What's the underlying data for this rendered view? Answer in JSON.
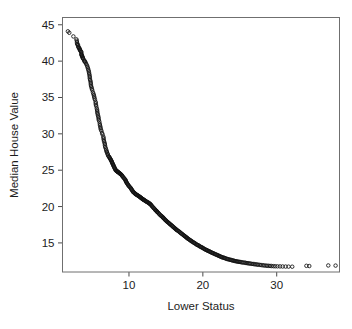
{
  "chart_data": {
    "type": "scatter",
    "title": "",
    "xlabel": "Lower Status",
    "ylabel": "Median House Value",
    "xlim": [
      1.0,
      38.5
    ],
    "ylim": [
      11.0,
      46.0
    ],
    "xticks": [
      10,
      20,
      30
    ],
    "yticks": [
      15,
      20,
      25,
      30,
      35,
      40,
      45
    ],
    "xtick_labels": [
      "10",
      "20",
      "30"
    ],
    "ytick_labels": [
      "15",
      "20",
      "25",
      "30",
      "35",
      "40",
      "45"
    ],
    "grid": false,
    "legend": null,
    "marker": "open-circle",
    "marker_color": "#101010",
    "background": "#ffffff",
    "frame_color": "#6f6f6f",
    "x": [
      1.73,
      1.92,
      2.47,
      2.88,
      2.94,
      2.96,
      2.98,
      3.01,
      3.11,
      3.13,
      3.16,
      3.26,
      3.32,
      3.33,
      3.38,
      3.43,
      3.53,
      3.54,
      3.56,
      3.57,
      3.59,
      3.65,
      3.7,
      3.73,
      3.76,
      3.81,
      3.95,
      3.97,
      4.03,
      4.14,
      4.21,
      4.32,
      4.38,
      4.45,
      4.5,
      4.56,
      4.59,
      4.63,
      4.67,
      4.69,
      4.7,
      4.74,
      4.81,
      4.82,
      4.84,
      4.86,
      4.93,
      4.97,
      5.03,
      5.12,
      5.19,
      5.25,
      5.29,
      5.33,
      5.39,
      5.49,
      5.5,
      5.52,
      5.57,
      5.64,
      5.68,
      5.7,
      5.72,
      5.77,
      5.81,
      5.87,
      5.89,
      5.91,
      5.98,
      6.05,
      6.07,
      6.12,
      6.15,
      6.19,
      6.27,
      6.36,
      6.43,
      6.53,
      6.56,
      6.58,
      6.62,
      6.68,
      6.73,
      6.75,
      6.78,
      6.86,
      6.92,
      6.96,
      7.01,
      7.08,
      7.12,
      7.18,
      7.26,
      7.34,
      7.39,
      7.43,
      7.51,
      7.56,
      7.6,
      7.67,
      7.7,
      7.73,
      7.79,
      7.83,
      7.88,
      7.91,
      7.96,
      8.01,
      8.05,
      8.1,
      8.16,
      8.2,
      8.26,
      8.33,
      8.4,
      8.44,
      8.47,
      8.51,
      8.58,
      8.65,
      8.7,
      8.77,
      8.81,
      8.88,
      8.94,
      9.04,
      9.1,
      9.16,
      9.25,
      9.33,
      9.42,
      9.5,
      9.53,
      9.59,
      9.62,
      9.68,
      9.74,
      9.8,
      9.88,
      9.93,
      10.0,
      10.11,
      10.19,
      10.27,
      10.3,
      10.4,
      10.45,
      10.5,
      10.58,
      10.63,
      10.71,
      10.8,
      10.87,
      10.92,
      10.97,
      11.08,
      11.16,
      11.22,
      11.28,
      11.38,
      11.45,
      11.5,
      11.57,
      11.64,
      11.69,
      11.74,
      11.81,
      11.88,
      11.93,
      11.98,
      12.03,
      12.12,
      12.2,
      12.26,
      12.33,
      12.43,
      12.5,
      12.6,
      12.67,
      12.73,
      12.8,
      12.86,
      12.93,
      13.0,
      13.09,
      13.15,
      13.27,
      13.33,
      13.44,
      13.51,
      13.6,
      13.65,
      13.72,
      13.79,
      13.83,
      13.9,
      13.99,
      14.09,
      14.15,
      14.27,
      14.33,
      14.44,
      14.52,
      14.59,
      14.65,
      14.7,
      14.79,
      14.86,
      14.94,
      15.02,
      15.1,
      15.17,
      15.27,
      15.37,
      15.45,
      15.52,
      15.6,
      15.71,
      15.79,
      15.88,
      15.94,
      16.03,
      16.12,
      16.21,
      16.29,
      16.35,
      16.42,
      16.51,
      16.6,
      16.72,
      16.8,
      16.9,
      16.98,
      17.07,
      17.16,
      17.27,
      17.36,
      17.44,
      17.55,
      17.6,
      17.7,
      17.79,
      17.86,
      17.93,
      18.03,
      18.13,
      18.22,
      18.33,
      18.4,
      18.5,
      18.6,
      18.72,
      18.8,
      18.9,
      19.01,
      19.11,
      19.2,
      19.31,
      19.4,
      19.52,
      19.6,
      19.73,
      19.82,
      19.92,
      20.02,
      20.14,
      20.22,
      20.32,
      20.45,
      20.54,
      20.62,
      20.73,
      20.85,
      20.94,
      21.03,
      21.14,
      21.24,
      21.35,
      21.46,
      21.57,
      21.68,
      21.79,
      21.9,
      22.02,
      22.11,
      22.22,
      22.33,
      22.44,
      22.55,
      22.66,
      22.78,
      22.89,
      23.0,
      23.12,
      23.24,
      23.35,
      23.46,
      23.6,
      23.72,
      23.85,
      23.97,
      24.1,
      24.22,
      24.35,
      24.5,
      24.62,
      24.77,
      24.91,
      25.05,
      25.2,
      25.35,
      25.5,
      25.68,
      25.82,
      25.98,
      26.14,
      26.3,
      26.45,
      26.64,
      26.82,
      26.98,
      27.15,
      27.33,
      27.5,
      27.71,
      27.9,
      28.1,
      28.3,
      28.5,
      28.7,
      28.9,
      29.1,
      29.3,
      29.55,
      29.8,
      30.1,
      30.45,
      30.8,
      31.2,
      31.6,
      32.1,
      34.02,
      34.41,
      36.98,
      37.97
    ],
    "y": [
      44.1,
      43.9,
      43.4,
      43.0,
      42.8,
      42.6,
      42.4,
      42.3,
      42.2,
      42.0,
      41.9,
      41.8,
      41.7,
      41.6,
      41.5,
      41.4,
      41.3,
      41.2,
      41.0,
      40.9,
      40.8,
      40.7,
      40.6,
      40.5,
      40.4,
      40.3,
      40.1,
      40.0,
      39.9,
      39.8,
      39.6,
      39.4,
      39.2,
      39.0,
      38.8,
      38.6,
      38.4,
      38.2,
      38.0,
      37.8,
      37.6,
      37.4,
      37.2,
      37.0,
      36.8,
      36.6,
      36.4,
      36.2,
      36.0,
      35.7,
      35.5,
      35.3,
      35.1,
      34.9,
      34.7,
      34.4,
      34.2,
      34.0,
      33.8,
      33.5,
      33.3,
      33.1,
      32.9,
      32.7,
      32.5,
      32.3,
      32.1,
      31.9,
      31.7,
      31.4,
      31.2,
      31.0,
      30.8,
      30.6,
      30.4,
      30.1,
      29.9,
      29.6,
      29.4,
      29.2,
      29.0,
      28.8,
      28.6,
      28.4,
      28.2,
      28.0,
      27.8,
      27.6,
      27.5,
      27.3,
      27.2,
      27.0,
      26.9,
      26.8,
      26.7,
      26.6,
      26.5,
      26.4,
      26.3,
      26.2,
      26.1,
      26.0,
      25.9,
      25.8,
      25.7,
      25.6,
      25.5,
      25.4,
      25.3,
      25.2,
      25.1,
      25.0,
      24.95,
      24.9,
      24.85,
      24.8,
      24.78,
      24.75,
      24.7,
      24.65,
      24.6,
      24.55,
      24.5,
      24.45,
      24.4,
      24.3,
      24.2,
      24.1,
      24.0,
      23.9,
      23.8,
      23.7,
      23.6,
      23.5,
      23.4,
      23.3,
      23.2,
      23.1,
      23.0,
      22.9,
      22.8,
      22.7,
      22.6,
      22.5,
      22.4,
      22.3,
      22.2,
      22.1,
      22.0,
      21.95,
      21.9,
      21.8,
      21.75,
      21.7,
      21.65,
      21.6,
      21.55,
      21.5,
      21.45,
      21.4,
      21.35,
      21.3,
      21.25,
      21.2,
      21.15,
      21.1,
      21.05,
      21.0,
      20.98,
      20.95,
      20.9,
      20.85,
      20.8,
      20.75,
      20.7,
      20.65,
      20.6,
      20.55,
      20.5,
      20.45,
      20.4,
      20.35,
      20.3,
      20.2,
      20.1,
      20.0,
      19.9,
      19.8,
      19.7,
      19.6,
      19.5,
      19.45,
      19.4,
      19.3,
      19.25,
      19.2,
      19.1,
      19.0,
      18.9,
      18.8,
      18.75,
      18.65,
      18.6,
      18.5,
      18.45,
      18.4,
      18.3,
      18.2,
      18.15,
      18.05,
      18.0,
      17.9,
      17.85,
      17.75,
      17.7,
      17.6,
      17.55,
      17.45,
      17.4,
      17.3,
      17.25,
      17.15,
      17.1,
      17.0,
      16.95,
      16.9,
      16.8,
      16.75,
      16.7,
      16.6,
      16.55,
      16.45,
      16.4,
      16.3,
      16.25,
      16.15,
      16.1,
      16.0,
      15.95,
      15.9,
      15.8,
      15.75,
      15.7,
      15.6,
      15.55,
      15.5,
      15.4,
      15.35,
      15.3,
      15.2,
      15.15,
      15.1,
      15.0,
      14.95,
      14.9,
      14.8,
      14.75,
      14.7,
      14.65,
      14.6,
      14.5,
      14.45,
      14.4,
      14.35,
      14.3,
      14.2,
      14.15,
      14.1,
      14.05,
      14.0,
      13.95,
      13.9,
      13.85,
      13.8,
      13.75,
      13.7,
      13.65,
      13.6,
      13.55,
      13.5,
      13.45,
      13.4,
      13.35,
      13.3,
      13.25,
      13.2,
      13.15,
      13.1,
      13.05,
      13.0,
      12.98,
      12.95,
      12.9,
      12.85,
      12.8,
      12.78,
      12.75,
      12.7,
      12.68,
      12.65,
      12.6,
      12.58,
      12.55,
      12.5,
      12.48,
      12.45,
      12.42,
      12.4,
      12.38,
      12.35,
      12.32,
      12.3,
      12.28,
      12.25,
      12.22,
      12.2,
      12.18,
      12.15,
      12.12,
      12.1,
      12.08,
      12.05,
      12.03,
      12.0,
      11.98,
      11.95,
      11.93,
      11.9,
      11.88,
      11.86,
      11.85,
      11.83,
      11.82,
      11.8,
      11.79,
      11.78,
      11.77,
      11.76,
      11.75,
      11.74,
      11.73,
      11.85,
      11.82,
      11.9,
      11.88
    ]
  },
  "axes": {
    "x_title": "Lower Status",
    "y_title": "Median House Value"
  }
}
